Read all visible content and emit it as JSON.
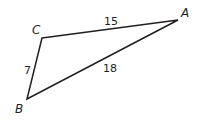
{
  "figure": {
    "type": "triangle",
    "stroke_color": "#231f20",
    "vertices": [
      {
        "label": "A",
        "x": 178,
        "y": 20
      },
      {
        "label": "B",
        "x": 27,
        "y": 99
      },
      {
        "label": "C",
        "x": 42,
        "y": 38
      }
    ],
    "sides": [
      {
        "between": "C-A",
        "length": "15"
      },
      {
        "between": "A-B",
        "length": "18"
      },
      {
        "between": "C-B",
        "length": "7"
      }
    ]
  }
}
